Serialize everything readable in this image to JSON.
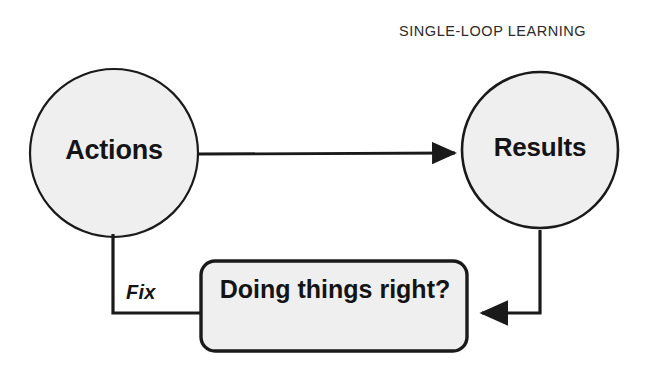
{
  "diagram": {
    "title": "SINGLE-LOOP LEARNING",
    "nodes": {
      "actions": {
        "label": "Actions",
        "shape": "circle"
      },
      "results": {
        "label": "Results",
        "shape": "circle"
      },
      "question": {
        "label": "Doing things right?",
        "shape": "rounded-rectangle"
      }
    },
    "edges": {
      "actions_to_results": {
        "label": "",
        "arrow": true
      },
      "results_to_question": {
        "label": "",
        "arrow": true
      },
      "question_to_actions": {
        "label": "Fix",
        "arrow": false
      }
    },
    "colors": {
      "shape_fill": "#efefef",
      "shape_stroke": "#1a1a1a",
      "text": "#141414",
      "title_text": "#2b2b2b",
      "background": "#ffffff"
    }
  }
}
